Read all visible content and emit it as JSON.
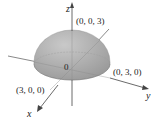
{
  "figure": {
    "type": "hemisphere",
    "radius": 3,
    "axes": {
      "x": "x",
      "y": "y",
      "z": "z"
    },
    "origin_label": "0",
    "points": {
      "top": "(0, 0, 3)",
      "y_intercept": "(0, 3, 0)",
      "x_intercept": "(3, 0, 0)"
    },
    "colors": {
      "surface": "#a9a9a9",
      "axis": "#444444"
    }
  }
}
